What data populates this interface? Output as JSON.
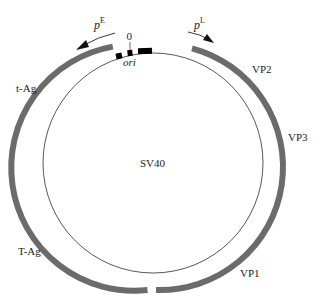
{
  "diagram": {
    "title": "SV40",
    "colors": {
      "gene_arc": "#6b6b6b",
      "genome_line": "#444444",
      "features": "#000000",
      "text": "#222222"
    },
    "origin_label": "0",
    "ori_label": "ori",
    "promoters": {
      "early": {
        "label": "p",
        "superscript": "E",
        "direction": "counterclockwise"
      },
      "late": {
        "label": "p",
        "superscript": "L",
        "direction": "clockwise"
      }
    },
    "early_genes": [
      {
        "label": "t-Ag"
      },
      {
        "label": "T-Ag"
      }
    ],
    "late_genes": [
      {
        "label": "VP2"
      },
      {
        "label": "VP3"
      },
      {
        "label": "VP1"
      }
    ]
  }
}
